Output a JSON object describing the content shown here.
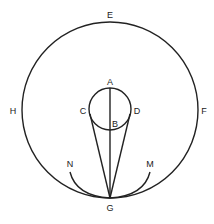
{
  "diagram": {
    "type": "geometric-figure",
    "labels": {
      "A": "A",
      "B": "B",
      "C": "C",
      "D": "D",
      "E": "E",
      "F": "F",
      "G": "G",
      "H": "H",
      "M": "M",
      "N": "N"
    },
    "colors": {
      "line": "#222222",
      "background": "#ffffff"
    }
  }
}
